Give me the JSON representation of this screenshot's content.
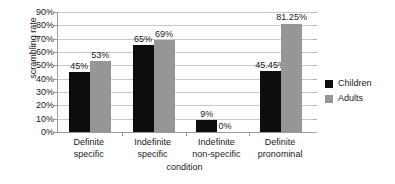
{
  "chart_data": {
    "type": "bar",
    "title": "",
    "subtitle": "",
    "xlabel": "condition",
    "ylabel": "scrambling rate",
    "categories": [
      "Definite specific",
      "Indefinite specific",
      "Indefinite non-specific",
      "Definite pronominal"
    ],
    "category_lines": [
      [
        "Definite",
        "specific"
      ],
      [
        "Indefinite",
        "specific"
      ],
      [
        "Indefinite",
        "non-specific"
      ],
      [
        "Definite",
        "pronominal"
      ]
    ],
    "series": [
      {
        "name": "Children",
        "color": "#0d0d0d",
        "values": [
          45,
          65,
          9,
          45.45
        ],
        "labels": [
          "45%",
          "65%",
          "9%",
          "45.45%"
        ]
      },
      {
        "name": "Adults",
        "color": "#969696",
        "values": [
          53,
          69,
          0,
          81.25
        ],
        "labels": [
          "53%",
          "69%",
          "0%",
          "81.25%"
        ]
      }
    ],
    "ylim": [
      0,
      90
    ],
    "ytick_step": 10,
    "ytick_labels": [
      "90%",
      "80%",
      "70%",
      "60%",
      "50%",
      "40%",
      "30%",
      "20%",
      "10%",
      "0%"
    ],
    "grid": true,
    "legend_position": "right",
    "legend_entries": [
      {
        "label": "Children",
        "color": "#0d0d0d"
      },
      {
        "label": "Adults",
        "color": "#969696"
      }
    ]
  }
}
